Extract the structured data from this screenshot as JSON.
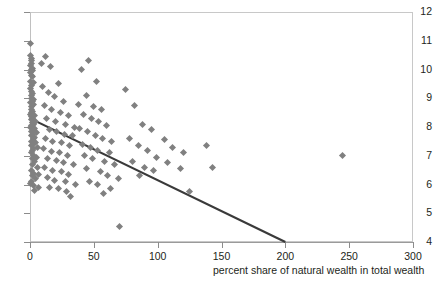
{
  "chart_data": {
    "type": "scatter",
    "title": "",
    "xlabel": "percent share of natural wealth in total wealth",
    "ylabel": "",
    "xlim": [
      0,
      300
    ],
    "ylim": [
      4,
      12
    ],
    "xticks": [
      0,
      50,
      100,
      150,
      200,
      250,
      300
    ],
    "yticks": [
      4,
      5,
      6,
      7,
      8,
      9,
      10,
      11,
      12
    ],
    "grid": false,
    "legend": "none",
    "marker": "diamond",
    "marker_color": "#808080",
    "trendline": {
      "type": "linear",
      "color": "#3a3a3a",
      "x": [
        0,
        200
      ],
      "y": [
        8.3,
        4.0
      ]
    },
    "points": [
      [
        0.4,
        10.9
      ],
      [
        0.6,
        10.5
      ],
      [
        1.0,
        10.4
      ],
      [
        0.8,
        10.3
      ],
      [
        1.3,
        10.2
      ],
      [
        0.5,
        10.15
      ],
      [
        1.6,
        10.05
      ],
      [
        0.9,
        10.0
      ],
      [
        2.0,
        9.95
      ],
      [
        0.6,
        9.9
      ],
      [
        1.1,
        9.8
      ],
      [
        1.8,
        9.75
      ],
      [
        0.7,
        9.6
      ],
      [
        2.4,
        9.55
      ],
      [
        1.2,
        9.45
      ],
      [
        0.5,
        9.35
      ],
      [
        1.5,
        9.25
      ],
      [
        2.1,
        9.15
      ],
      [
        0.8,
        9.1
      ],
      [
        1.0,
        9.0
      ],
      [
        3.0,
        8.95
      ],
      [
        1.7,
        8.9
      ],
      [
        0.6,
        8.85
      ],
      [
        2.6,
        8.8
      ],
      [
        1.3,
        8.7
      ],
      [
        0.9,
        8.6
      ],
      [
        2.2,
        8.55
      ],
      [
        1.5,
        8.5
      ],
      [
        0.5,
        8.45
      ],
      [
        3.4,
        8.4
      ],
      [
        1.1,
        8.35
      ],
      [
        2.0,
        8.3
      ],
      [
        0.8,
        8.25
      ],
      [
        4.0,
        8.2
      ],
      [
        1.6,
        8.15
      ],
      [
        2.8,
        8.1
      ],
      [
        1.2,
        8.05
      ],
      [
        0.7,
        8.0
      ],
      [
        3.2,
        7.95
      ],
      [
        2.4,
        7.9
      ],
      [
        1.4,
        7.85
      ],
      [
        5.0,
        7.8
      ],
      [
        1.9,
        7.75
      ],
      [
        0.9,
        7.7
      ],
      [
        3.8,
        7.65
      ],
      [
        2.6,
        7.6
      ],
      [
        1.5,
        7.5
      ],
      [
        4.4,
        7.45
      ],
      [
        2.2,
        7.4
      ],
      [
        1.1,
        7.35
      ],
      [
        6.0,
        7.3
      ],
      [
        3.0,
        7.25
      ],
      [
        1.8,
        7.2
      ],
      [
        0.8,
        7.1
      ],
      [
        2.5,
        7.0
      ],
      [
        4.8,
        6.95
      ],
      [
        1.6,
        6.9
      ],
      [
        3.5,
        6.8
      ],
      [
        2.0,
        6.7
      ],
      [
        5.5,
        6.6
      ],
      [
        1.2,
        6.5
      ],
      [
        3.0,
        6.4
      ],
      [
        7.0,
        6.35
      ],
      [
        2.2,
        6.3
      ],
      [
        4.2,
        6.2
      ],
      [
        1.5,
        6.1
      ],
      [
        0.5,
        6.05
      ],
      [
        2.8,
        5.95
      ],
      [
        6.5,
        5.9
      ],
      [
        3.6,
        5.8
      ],
      [
        9.0,
        10.2
      ],
      [
        12.0,
        10.45
      ],
      [
        16.0,
        10.1
      ],
      [
        22.0,
        9.5
      ],
      [
        10.0,
        9.4
      ],
      [
        14.5,
        9.2
      ],
      [
        19.0,
        9.05
      ],
      [
        26.0,
        8.9
      ],
      [
        11.0,
        8.75
      ],
      [
        17.0,
        8.6
      ],
      [
        24.0,
        8.5
      ],
      [
        30.0,
        8.4
      ],
      [
        13.0,
        8.3
      ],
      [
        20.0,
        8.2
      ],
      [
        28.0,
        8.1
      ],
      [
        35.0,
        8.0
      ],
      [
        15.0,
        7.9
      ],
      [
        21.0,
        7.85
      ],
      [
        27.0,
        7.75
      ],
      [
        33.0,
        7.7
      ],
      [
        12.0,
        7.6
      ],
      [
        18.0,
        7.5
      ],
      [
        25.0,
        7.45
      ],
      [
        31.0,
        7.35
      ],
      [
        10.5,
        7.25
      ],
      [
        16.5,
        7.15
      ],
      [
        23.0,
        7.1
      ],
      [
        29.0,
        7.0
      ],
      [
        14.0,
        6.9
      ],
      [
        20.5,
        6.85
      ],
      [
        26.5,
        6.75
      ],
      [
        34.0,
        6.7
      ],
      [
        11.5,
        6.6
      ],
      [
        17.5,
        6.5
      ],
      [
        24.5,
        6.45
      ],
      [
        30.5,
        6.35
      ],
      [
        13.5,
        6.25
      ],
      [
        19.5,
        6.15
      ],
      [
        27.5,
        6.1
      ],
      [
        36.0,
        6.0
      ],
      [
        15.5,
        5.9
      ],
      [
        22.5,
        5.85
      ],
      [
        28.5,
        5.75
      ],
      [
        32.0,
        5.6
      ],
      [
        40.0,
        10.0
      ],
      [
        46.0,
        10.3
      ],
      [
        52.0,
        9.6
      ],
      [
        44.0,
        9.1
      ],
      [
        38.0,
        8.8
      ],
      [
        50.0,
        8.7
      ],
      [
        56.0,
        8.6
      ],
      [
        42.0,
        8.45
      ],
      [
        48.0,
        8.3
      ],
      [
        54.0,
        8.2
      ],
      [
        60.0,
        8.05
      ],
      [
        39.0,
        7.95
      ],
      [
        45.0,
        7.85
      ],
      [
        51.0,
        7.7
      ],
      [
        57.0,
        7.6
      ],
      [
        64.0,
        7.5
      ],
      [
        41.0,
        7.4
      ],
      [
        47.0,
        7.3
      ],
      [
        53.0,
        7.2
      ],
      [
        62.0,
        7.1
      ],
      [
        43.0,
        7.0
      ],
      [
        49.0,
        6.9
      ],
      [
        58.0,
        6.8
      ],
      [
        66.0,
        6.7
      ],
      [
        44.5,
        6.55
      ],
      [
        55.0,
        6.45
      ],
      [
        61.0,
        6.3
      ],
      [
        69.0,
        6.2
      ],
      [
        46.5,
        6.1
      ],
      [
        52.5,
        6.0
      ],
      [
        63.0,
        5.85
      ],
      [
        57.5,
        5.7
      ],
      [
        70.0,
        4.55
      ],
      [
        75.0,
        9.3
      ],
      [
        82.0,
        8.75
      ],
      [
        88.0,
        8.1
      ],
      [
        95.0,
        7.9
      ],
      [
        78.0,
        7.6
      ],
      [
        85.0,
        7.35
      ],
      [
        92.0,
        7.2
      ],
      [
        99.0,
        6.95
      ],
      [
        80.0,
        6.8
      ],
      [
        90.0,
        6.6
      ],
      [
        97.0,
        6.5
      ],
      [
        86.0,
        6.3
      ],
      [
        105.0,
        7.55
      ],
      [
        112.0,
        7.3
      ],
      [
        120.0,
        7.1
      ],
      [
        108.0,
        6.75
      ],
      [
        118.0,
        6.55
      ],
      [
        125.0,
        5.75
      ],
      [
        143.0,
        6.6
      ],
      [
        138.0,
        7.35
      ],
      [
        245.0,
        7.0
      ]
    ]
  },
  "axis": {
    "y_tick_labels": [
      "12",
      "11",
      "10",
      "9",
      "8",
      "7",
      "6",
      "5",
      "4"
    ],
    "x_tick_labels": [
      "0",
      "50",
      "100",
      "150",
      "200",
      "250",
      "300"
    ]
  }
}
